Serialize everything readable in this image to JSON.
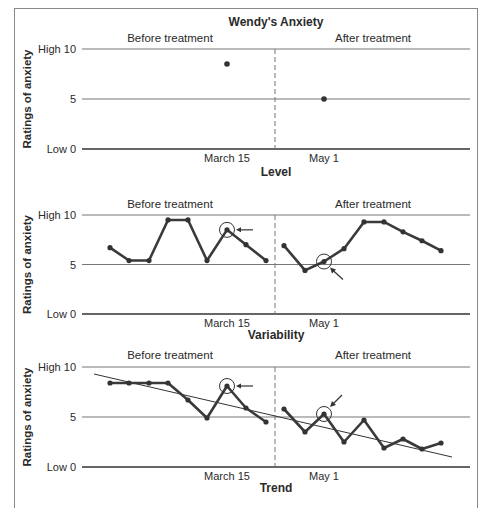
{
  "figure_title": "Wendy's Anxiety",
  "chart_data": [
    {
      "type": "scatter",
      "title": "Level",
      "ylabel": "Ratings of anxiety",
      "ylim": [
        0,
        10
      ],
      "yticks": [
        "Low 0",
        "5",
        "High 10"
      ],
      "xticks": [
        "March 15",
        "May 1"
      ],
      "phases": [
        "Before treatment",
        "After treatment"
      ],
      "series": [
        {
          "name": "Before treatment",
          "x": [
            "March 15"
          ],
          "values": [
            8.5
          ]
        },
        {
          "name": "After treatment",
          "x": [
            "May 1"
          ],
          "values": [
            5.0
          ]
        }
      ],
      "grid": true
    },
    {
      "type": "line",
      "title": "Variability",
      "ylabel": "Ratings of anxiety",
      "ylim": [
        0,
        10
      ],
      "yticks": [
        "Low 0",
        "5",
        "High 10"
      ],
      "xticks": [
        "March 15",
        "May 1"
      ],
      "phases": [
        "Before treatment",
        "After treatment"
      ],
      "series": [
        {
          "name": "Before treatment",
          "values": [
            6.7,
            5.4,
            5.4,
            9.5,
            9.5,
            5.4,
            8.5,
            7.0,
            5.4
          ]
        },
        {
          "name": "After treatment",
          "values": [
            6.9,
            4.4,
            5.3,
            6.6,
            9.3,
            9.3,
            8.3,
            7.4,
            6.4
          ]
        }
      ],
      "annotations": [
        "circled point March 15 (8.5) with arrow",
        "circled point May 1 (5.3) with arrow"
      ],
      "grid": true
    },
    {
      "type": "line",
      "title": "Trend",
      "ylabel": "Ratings of anxiety",
      "ylim": [
        0,
        10
      ],
      "yticks": [
        "Low 0",
        "5",
        "High 10"
      ],
      "xticks": [
        "March 15",
        "May 1"
      ],
      "phases": [
        "Before treatment",
        "After treatment"
      ],
      "series": [
        {
          "name": "Before treatment",
          "values": [
            8.4,
            8.4,
            8.4,
            8.4,
            6.7,
            4.9,
            8.1,
            5.9,
            4.5
          ]
        },
        {
          "name": "After treatment",
          "values": [
            5.8,
            3.5,
            5.3,
            2.5,
            4.7,
            1.9,
            2.8,
            1.8,
            2.4
          ]
        }
      ],
      "trend_line": {
        "start": 9.3,
        "end": 1.0
      },
      "annotations": [
        "circled point March 15 (8.1) with arrow",
        "circled point May 1 (5.3) with arrow"
      ],
      "grid": true
    }
  ]
}
